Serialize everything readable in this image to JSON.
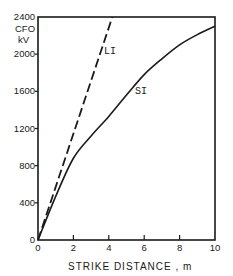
{
  "chart_data": {
    "type": "line",
    "title": "",
    "xlabel": "STRIKE DISTANCE , m",
    "ylabel": "CFO kV",
    "ylabel_lines": [
      "CFO",
      "kV"
    ],
    "xlim": [
      0,
      10
    ],
    "ylim": [
      0,
      2400
    ],
    "x_ticks": [
      "0",
      "2",
      "4",
      "6",
      "8",
      "10"
    ],
    "y_ticks": [
      "0",
      "400",
      "800",
      "1200",
      "1600",
      "2000",
      "2400"
    ],
    "grid": false,
    "legend": "inline labels",
    "series": [
      {
        "name": "LI",
        "style": "dashed",
        "x": [
          0,
          1,
          2,
          3,
          4,
          4.2
        ],
        "y": [
          0,
          570,
          1140,
          1710,
          2280,
          2400
        ]
      },
      {
        "name": "SI",
        "style": "solid",
        "x": [
          0,
          1,
          2,
          3,
          4,
          5,
          6,
          7,
          8,
          9,
          10
        ],
        "y": [
          0,
          470,
          880,
          1120,
          1330,
          1560,
          1780,
          1950,
          2100,
          2210,
          2300
        ]
      }
    ],
    "annotations": [
      {
        "text": "LI",
        "x": 4.0,
        "y": 2030
      },
      {
        "text": "SI",
        "x": 5.7,
        "y": 1600
      }
    ]
  }
}
